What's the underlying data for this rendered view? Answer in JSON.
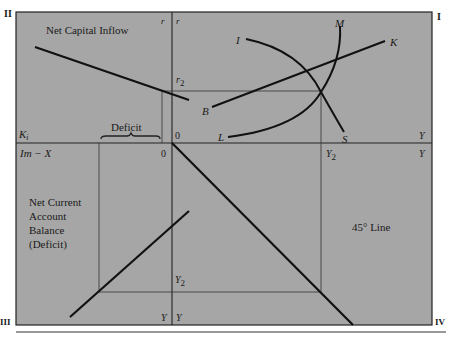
{
  "diagram": {
    "type": "IS-LM-BP four-quadrant diagram",
    "colors": {
      "background": "#a6a6a6",
      "line": "#111111",
      "page": "#ffffff"
    },
    "quadrants": {
      "q1": "I",
      "q2": "II",
      "q3": "III",
      "q4": "IV"
    },
    "titles": {
      "capital_inflow": "Net Capital Inflow",
      "current_account_1": "Net Current",
      "current_account_2": "Account",
      "current_account_3": "Balance",
      "current_account_4": "(Deficit)",
      "deficit": "Deficit",
      "line_45": "45° Line"
    },
    "axes": {
      "r_left": "r",
      "r_right": "r",
      "r2": "r",
      "r2_sub": "2",
      "origin_upper": "0",
      "origin_left": "0",
      "k": "K",
      "k_sub": "i",
      "im_x": "Im − X",
      "y_right_upper": "Y",
      "y_right_lower": "Y",
      "y2_upper": "Y",
      "y2_upper_sub": "2",
      "y2_lower": "Y",
      "y2_lower_sub": "2",
      "y_bottom_left": "Y",
      "y_bottom_right": "Y"
    },
    "curves": {
      "is_start": "I",
      "is_end": "S",
      "lm_start": "L",
      "lm_end": "M",
      "bp_start": "B",
      "bp_end": "K"
    }
  }
}
